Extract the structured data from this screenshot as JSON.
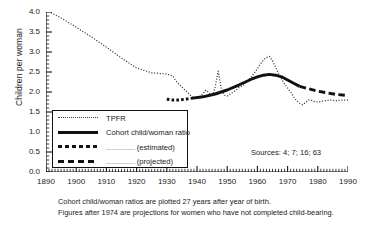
{
  "chart_data": {
    "type": "line",
    "title": "",
    "xlabel": "",
    "ylabel": "Children per woman",
    "xlim": [
      1890,
      1990
    ],
    "ylim": [
      0.0,
      4.0
    ],
    "xticks": [
      1890,
      1900,
      1910,
      1920,
      1930,
      1940,
      1950,
      1960,
      1970,
      1980,
      1990
    ],
    "yticks": [
      "0.0",
      "0.5",
      "1.0",
      "1.5",
      "2.0",
      "2.5",
      "3.0",
      "3.5",
      "4.0"
    ],
    "ytick_step": 0.5,
    "minor_tick_interval_years": 1,
    "grid": false,
    "legend_position": "inner-left",
    "series": [
      {
        "name": "TPFR",
        "style": "fine-dotted",
        "color": "#3a3a3a",
        "x": [
          1890,
          1895,
          1900,
          1905,
          1910,
          1915,
          1920,
          1925,
          1930,
          1932,
          1933,
          1935,
          1936,
          1937,
          1938,
          1939,
          1940,
          1941,
          1942,
          1943,
          1944,
          1945,
          1946,
          1947,
          1948,
          1949,
          1950,
          1951,
          1952,
          1953,
          1954,
          1955,
          1956,
          1957,
          1958,
          1959,
          1960,
          1961,
          1962,
          1963,
          1964,
          1965,
          1966,
          1967,
          1968,
          1969,
          1970,
          1971,
          1972,
          1973,
          1974,
          1975,
          1976,
          1977,
          1978,
          1979,
          1980,
          1981,
          1982,
          1983,
          1984,
          1985,
          1986,
          1987,
          1988,
          1989,
          1990
        ],
        "y": [
          4.05,
          3.85,
          3.62,
          3.38,
          3.12,
          2.85,
          2.6,
          2.48,
          2.45,
          2.4,
          2.28,
          2.12,
          2.05,
          1.98,
          1.9,
          1.86,
          1.83,
          1.88,
          1.96,
          2.05,
          1.98,
          1.88,
          2.12,
          2.52,
          2.1,
          1.92,
          1.9,
          1.95,
          2.0,
          2.05,
          2.12,
          2.15,
          2.22,
          2.3,
          2.38,
          2.48,
          2.58,
          2.7,
          2.8,
          2.86,
          2.89,
          2.78,
          2.62,
          2.46,
          2.32,
          2.2,
          2.1,
          2.0,
          1.88,
          1.78,
          1.72,
          1.68,
          1.74,
          1.8,
          1.79,
          1.76,
          1.75,
          1.76,
          1.78,
          1.79,
          1.8,
          1.79,
          1.78,
          1.79,
          1.8,
          1.8,
          1.8
        ]
      },
      {
        "name": "Cohort child/woman ratio",
        "style": "solid",
        "color": "#111111",
        "x": [
          1938,
          1942,
          1946,
          1950,
          1954,
          1958,
          1960,
          1962,
          1964,
          1966,
          1968,
          1970,
          1972,
          1974
        ],
        "y": [
          1.84,
          1.88,
          1.95,
          2.05,
          2.18,
          2.32,
          2.38,
          2.42,
          2.44,
          2.42,
          2.38,
          2.3,
          2.22,
          2.14
        ]
      },
      {
        "name": "(estimated)",
        "style": "thick-dotted",
        "color": "#111111",
        "x": [
          1930,
          1932,
          1934,
          1936,
          1938
        ],
        "y": [
          1.82,
          1.8,
          1.8,
          1.82,
          1.84
        ]
      },
      {
        "name": "(projected)",
        "style": "thick-dashed",
        "color": "#111111",
        "x": [
          1974,
          1977,
          1980,
          1983,
          1986,
          1989
        ],
        "y": [
          2.14,
          2.08,
          2.02,
          1.98,
          1.94,
          1.92
        ]
      }
    ]
  },
  "axes": {
    "y_label": "Children per woman",
    "y_tick_labels": [
      "4.0",
      "3.5",
      "3.0",
      "2.5",
      "2.0",
      "1.5",
      "1.0",
      "0.5",
      "0.0"
    ],
    "x_tick_labels": [
      "1890",
      "1900",
      "1910",
      "1920",
      "1930",
      "1940",
      "1950",
      "1960",
      "1970",
      "1980",
      "1990"
    ]
  },
  "legend": {
    "items": [
      {
        "label": "TPFR",
        "leader": "",
        "style": "fine-dotted"
      },
      {
        "label": "Cohort child/woman ratio",
        "leader": "",
        "style": "solid"
      },
      {
        "label": "(estimated)",
        "leader": "................",
        "style": "thick-dotted"
      },
      {
        "label": "(projected)",
        "leader": "................",
        "style": "thick-dashed"
      }
    ]
  },
  "annotations": {
    "sources": "Sources: 4; 7; 16; 63",
    "caption_line_1": "Cohort child/woman ratios are plotted 27 years after year of birth.",
    "caption_line_2": "Figures after 1974 are projections for women who have not completed child-bearing."
  }
}
